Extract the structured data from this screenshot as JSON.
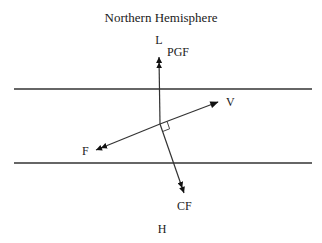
{
  "title": "Northern Hemisphere",
  "labels": {
    "low": "L",
    "high": "H",
    "pgf": "PGF",
    "velocity": "V",
    "friction": "F",
    "coriolis": "CF"
  },
  "colors": {
    "line": "#333333",
    "arrow": "#111111",
    "text": "#1a1a1a",
    "background": "#ffffff"
  },
  "geometry": {
    "origin": [
      160,
      124
    ],
    "isobar_top_y": 89,
    "isobar_bottom_y": 163,
    "isobar_x_range": [
      14,
      312
    ],
    "vectors": {
      "pgf": [
        159,
        57
      ],
      "velocity": [
        218,
        102
      ],
      "friction": [
        96,
        150
      ],
      "coriolis": [
        184,
        193
      ]
    }
  }
}
